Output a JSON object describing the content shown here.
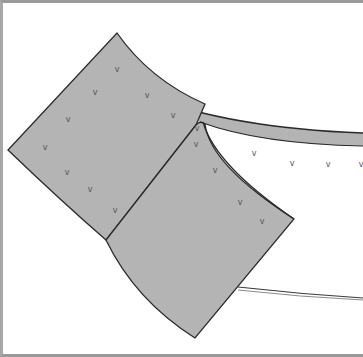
{
  "map": {
    "title": "",
    "colors": {
      "parcel_fill": "#b4b4b4",
      "outline": "#2a2a2a",
      "road_fill": "#b4b4b4",
      "background": "#ffffff",
      "frame": "#9a9a9a"
    },
    "vegetation_symbol": "v",
    "parcels": [
      {
        "id": "upper-parcel",
        "marks": [
          [
            117,
            72
          ],
          [
            95,
            95
          ],
          [
            147,
            98
          ],
          [
            173,
            118
          ],
          [
            68,
            122
          ],
          [
            45,
            150
          ],
          [
            67,
            175
          ],
          [
            90,
            192
          ],
          [
            115,
            213
          ]
        ]
      },
      {
        "id": "lower-parcel",
        "marks": [
          [
            197,
            131
          ],
          [
            196,
            147
          ],
          [
            215,
            173
          ],
          [
            240,
            205
          ],
          [
            262,
            224
          ]
        ]
      }
    ],
    "open_area_marks": [
      [
        254,
        156
      ],
      [
        292,
        166
      ],
      [
        328,
        167
      ],
      [
        361,
        167
      ]
    ],
    "roads": [
      "upper-road",
      "lower-road"
    ]
  }
}
